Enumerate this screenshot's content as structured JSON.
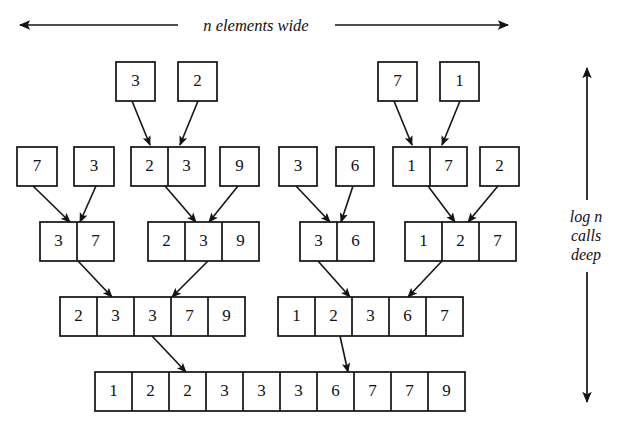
{
  "figure": {
    "title_label_top": "n elements wide",
    "label_side_lines": [
      "log n",
      "calls",
      "deep"
    ],
    "ink_color": "#111111",
    "background_color": "#ffffff"
  },
  "chart_data": {
    "type": "diagram",
    "subtype": "merge-sort-recursion-tree",
    "annotations": [
      "n elements wide",
      "log n calls deep"
    ],
    "levels": [
      {
        "level": 0,
        "name": "singletons-top",
        "groups": [
          {
            "id": "t0",
            "values": [
              "3"
            ]
          },
          {
            "id": "t1",
            "values": [
              "2"
            ]
          },
          {
            "id": "t2",
            "values": [
              "7"
            ]
          },
          {
            "id": "t3",
            "values": [
              "1"
            ]
          }
        ]
      },
      {
        "level": 1,
        "name": "row-two",
        "groups": [
          {
            "id": "r1g0",
            "values": [
              "7"
            ]
          },
          {
            "id": "r1g1",
            "values": [
              "3"
            ]
          },
          {
            "id": "r1g2",
            "values": [
              "2",
              "3"
            ]
          },
          {
            "id": "r1g3",
            "values": [
              "9"
            ]
          },
          {
            "id": "r1g4",
            "values": [
              "3"
            ]
          },
          {
            "id": "r1g5",
            "values": [
              "6"
            ]
          },
          {
            "id": "r1g6",
            "values": [
              "1",
              "7"
            ]
          },
          {
            "id": "r1g7",
            "values": [
              "2"
            ]
          }
        ]
      },
      {
        "level": 2,
        "name": "row-three",
        "groups": [
          {
            "id": "r2g0",
            "values": [
              "3",
              "7"
            ]
          },
          {
            "id": "r2g1",
            "values": [
              "2",
              "3",
              "9"
            ]
          },
          {
            "id": "r2g2",
            "values": [
              "3",
              "6"
            ]
          },
          {
            "id": "r2g3",
            "values": [
              "1",
              "2",
              "7"
            ]
          }
        ]
      },
      {
        "level": 3,
        "name": "row-four",
        "groups": [
          {
            "id": "r3g0",
            "values": [
              "2",
              "3",
              "3",
              "7",
              "9"
            ]
          },
          {
            "id": "r3g1",
            "values": [
              "1",
              "2",
              "3",
              "6",
              "7"
            ]
          }
        ]
      },
      {
        "level": 4,
        "name": "row-final",
        "groups": [
          {
            "id": "r4g0",
            "values": [
              "1",
              "2",
              "2",
              "3",
              "3",
              "3",
              "6",
              "7",
              "7",
              "9"
            ]
          }
        ]
      }
    ]
  }
}
